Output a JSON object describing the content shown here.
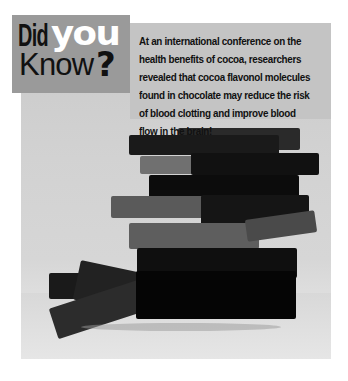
{
  "callout": {
    "title_part1": "Did",
    "title_part2": "you",
    "title_part3": "Know",
    "title_part4": "?",
    "fact_text": "At an international conference on the health benefits of cocoa, researchers revealed that cocoa flavonol molecules found in chocolate may reduce the risk of blood clotting and improve blood flow in the brain!"
  },
  "photo": {
    "subject": "stack of dark chocolate pieces",
    "style": "grayscale"
  },
  "colors": {
    "title_box": "#9a9a9a",
    "text_panel": "#c4c4c4",
    "text": "#111111",
    "highlight_word": "#ffffff"
  }
}
